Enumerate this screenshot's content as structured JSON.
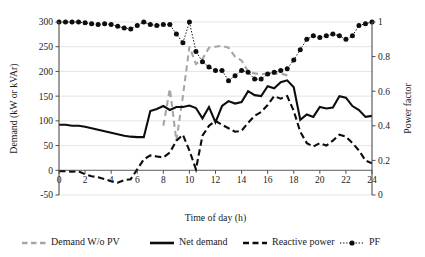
{
  "chart_data": {
    "type": "line",
    "title": "",
    "xlabel": "Time of day (h)",
    "ylabel": "Demand (kW or kVAr)",
    "y2label": "Power factor",
    "xlim": [
      0,
      24
    ],
    "ylim": [
      -50,
      300
    ],
    "y2lim": [
      0,
      1
    ],
    "grid": true,
    "legend_position": "bottom",
    "xticks": [
      0,
      2,
      4,
      6,
      8,
      10,
      12,
      14,
      16,
      18,
      20,
      22,
      24
    ],
    "xtick_labels": [
      "0",
      "2",
      "4",
      "6",
      "8",
      "10",
      "12",
      "14",
      "16",
      "18",
      "20",
      "22",
      "24"
    ],
    "yticks": [
      -50,
      0,
      50,
      100,
      150,
      200,
      250,
      300
    ],
    "ytick_labels": [
      "-50",
      "0",
      "50",
      "100",
      "150",
      "200",
      "250",
      "300"
    ],
    "y2ticks": [
      0,
      0.2,
      0.4,
      0.6,
      0.8,
      1
    ],
    "y2tick_labels": [
      "0",
      "0.2",
      "0.4",
      "0.6",
      "0.8",
      "1"
    ],
    "x": [
      0,
      0.5,
      1,
      1.5,
      2,
      2.5,
      3,
      3.5,
      4,
      4.5,
      5,
      5.5,
      6,
      6.5,
      7,
      7.5,
      8,
      8.5,
      9,
      9.5,
      10,
      10.5,
      11,
      11.5,
      12,
      12.5,
      13,
      13.5,
      14,
      14.5,
      15,
      15.5,
      16,
      16.5,
      17,
      17.5,
      18,
      18.5,
      19,
      19.5,
      20,
      20.5,
      21,
      21.5,
      22,
      22.5,
      23,
      23.5,
      24
    ],
    "series": [
      {
        "name": "Demand W/o PV",
        "axis": "left",
        "style": "dashed-gray",
        "values": [
          null,
          null,
          null,
          null,
          null,
          null,
          null,
          null,
          null,
          null,
          null,
          null,
          null,
          null,
          null,
          null,
          90,
          165,
          60,
          150,
          250,
          215,
          225,
          248,
          250,
          252,
          248,
          230,
          222,
          200,
          196,
          194,
          196,
          195,
          196,
          192,
          null,
          null,
          null,
          null,
          null,
          null,
          null,
          null,
          null,
          null,
          null,
          null,
          null
        ]
      },
      {
        "name": "Net demand",
        "axis": "left",
        "style": "solid-black",
        "values": [
          92,
          92,
          90,
          90,
          88,
          85,
          82,
          79,
          76,
          73,
          70,
          68,
          67,
          67,
          120,
          124,
          130,
          122,
          128,
          128,
          131,
          126,
          105,
          128,
          97,
          130,
          140,
          135,
          138,
          160,
          152,
          150,
          170,
          166,
          178,
          182,
          168,
          102,
          113,
          108,
          128,
          125,
          127,
          150,
          147,
          130,
          122,
          108,
          110
        ]
      },
      {
        "name": "Reactive power",
        "axis": "left",
        "style": "dashed-black",
        "values": [
          -2,
          -2,
          -3,
          -2,
          -8,
          -12,
          -14,
          -18,
          -22,
          -25,
          -20,
          -18,
          2,
          22,
          30,
          28,
          26,
          36,
          60,
          72,
          40,
          2,
          70,
          90,
          100,
          92,
          85,
          78,
          80,
          96,
          110,
          118,
          132,
          150,
          145,
          150,
          120,
          78,
          55,
          48,
          55,
          50,
          60,
          72,
          68,
          55,
          40,
          20,
          14
        ]
      },
      {
        "name": "PF",
        "axis": "right",
        "style": "dotted-marker",
        "values": [
          1.0,
          1.0,
          1.0,
          1.0,
          0.995,
          0.99,
          0.985,
          0.99,
          0.985,
          0.975,
          0.965,
          0.96,
          0.98,
          1.0,
          0.985,
          0.98,
          0.985,
          0.985,
          0.93,
          0.88,
          1.0,
          0.83,
          0.77,
          0.74,
          0.72,
          0.72,
          0.66,
          0.69,
          0.72,
          0.71,
          0.67,
          0.67,
          0.7,
          0.71,
          0.72,
          0.73,
          0.78,
          0.84,
          0.9,
          0.92,
          0.91,
          0.92,
          0.93,
          0.92,
          0.9,
          0.92,
          0.98,
          0.99,
          1.0
        ]
      }
    ]
  },
  "legend": {
    "items": [
      {
        "label": "Demand W/o PV",
        "style": "dashed-gray"
      },
      {
        "label": "Net demand",
        "style": "solid-black"
      },
      {
        "label": "Reactive power",
        "style": "dashed-black"
      },
      {
        "label": "PF",
        "style": "dotted-marker"
      }
    ]
  },
  "colors": {
    "demand_wo_pv": "#a6a6a6",
    "net_demand": "#0d0d0d",
    "reactive_power": "#0d0d0d",
    "pf": "#0d0d0d",
    "grid": "#e2e2e2",
    "axis": "#4d4d4d",
    "background": "#ffffff"
  }
}
